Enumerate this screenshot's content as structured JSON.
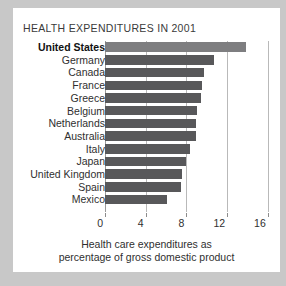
{
  "chart_data": {
    "type": "bar",
    "orientation": "horizontal",
    "title": "HEALTH EXPENDITURES IN 2001",
    "xlabel": "Health care expenditures as percentage of gross domestic product",
    "ylabel": "",
    "xlim": [
      0,
      17.2
    ],
    "xticks": [
      0,
      4,
      8,
      12,
      16
    ],
    "xtick_labels": [
      "0",
      "4",
      "8",
      "12",
      "16"
    ],
    "grid": true,
    "legend": null,
    "categories": [
      "United States",
      "Germany",
      "Canada",
      "France",
      "Greece",
      "Belgium",
      "Netherlands",
      "Australia",
      "Italy",
      "Japan",
      "United Kingdom",
      "Spain",
      "Mexico"
    ],
    "values": [
      13.9,
      10.7,
      9.7,
      9.5,
      9.4,
      9.0,
      8.9,
      8.9,
      8.4,
      8.0,
      7.6,
      7.5,
      6.1
    ],
    "highlight_index": 0
  },
  "caption": {
    "line1": "Health care expenditures as",
    "line2": "percentage of gross domestic product"
  },
  "colors": {
    "bar": "#58585a",
    "bar_highlight": "#7e7e80",
    "gridline": "#b9b9b9",
    "card_background": "#ffffff",
    "page_background": "#c8c8c8",
    "text": "#2f2f2f"
  }
}
